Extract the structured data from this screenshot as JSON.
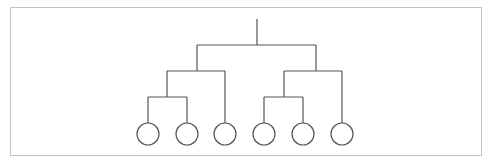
{
  "diagram": {
    "type": "tree",
    "colors": {
      "line": "#555555",
      "frame": "#c4c4c4",
      "background": "#ffffff"
    },
    "tree": {
      "id": "root",
      "children": [
        {
          "id": "left",
          "children": [
            {
              "id": "left-inner",
              "children": [
                {
                  "id": "leaf-1"
                },
                {
                  "id": "leaf-2"
                }
              ]
            },
            {
              "id": "leaf-3"
            }
          ]
        },
        {
          "id": "right",
          "children": [
            {
              "id": "right-inner",
              "children": [
                {
                  "id": "leaf-4"
                },
                {
                  "id": "leaf-5"
                }
              ]
            },
            {
              "id": "leaf-6"
            }
          ]
        }
      ]
    },
    "leaf_count": 6
  }
}
